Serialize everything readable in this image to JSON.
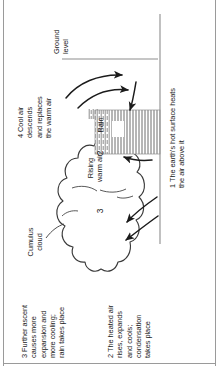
{
  "diagram": {
    "orientation": "rotated-90-ccw",
    "background_color": "#ffffff",
    "ink_color": "#1b1b1b",
    "frame_color": "#9a9a9a",
    "annotations": [
      {
        "id": "1",
        "number": "1",
        "text": "1 The earth's hot surface heats\nthe air above it"
      },
      {
        "id": "2",
        "number": "2",
        "text": "2 The heated air\nrises, expands\nand cools;\ncondensation\ntakes place"
      },
      {
        "id": "3",
        "number": "3",
        "text": "3 Further ascent\ncauses more\nexpansion and\nmore cooling;\nrain takes place"
      },
      {
        "id": "4",
        "number": "4",
        "text": "4 Cool air\ndescends\nand replaces\nthe warm air"
      }
    ],
    "labels": {
      "cumulus_cloud": "Cumulus\ncloud",
      "rising_warm_air": "Rising\nwarm air",
      "rain": "Rain",
      "ground_level": "Ground\nlevel",
      "cloud_marker_3": "3",
      "updraft_marker_2": "2"
    }
  }
}
